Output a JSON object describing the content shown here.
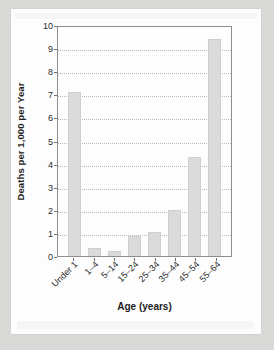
{
  "figure": {
    "background_color": "#d9d9d7",
    "paper_color": "#fdfdfd",
    "bar_color": "#dadada",
    "bar_border_color": "#cfcfcf",
    "axis_color": "#8d8d8d",
    "grid_color": "#b9b9b9",
    "text_color": "#2b2b2b"
  },
  "chart_data": {
    "type": "bar",
    "title": "",
    "subtitle": "",
    "xlabel": "Age (years)",
    "ylabel": "Deaths per 1,000 per Year",
    "categories": [
      "Under 1",
      "1–4",
      "5–14",
      "15–24",
      "25–34",
      "35–44",
      "45–54",
      "55–64"
    ],
    "values": [
      7.1,
      0.35,
      0.2,
      0.85,
      1.05,
      2.0,
      4.3,
      9.4
    ],
    "ylim": [
      0,
      10
    ],
    "ytick_labels": [
      "0",
      "1",
      "2",
      "3",
      "4",
      "5",
      "6",
      "7",
      "8",
      "9",
      "10"
    ],
    "ytick_values": [
      0,
      1,
      2,
      3,
      4,
      5,
      6,
      7,
      8,
      9,
      10
    ],
    "grid": "horizontal-dotted",
    "legend": "none",
    "xtick_rotation": -45,
    "annotations": []
  }
}
